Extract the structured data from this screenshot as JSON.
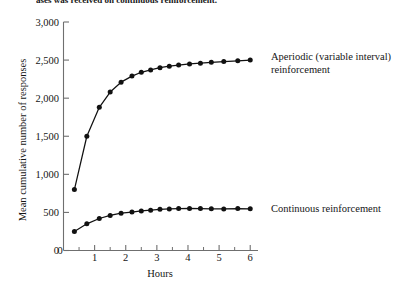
{
  "caption": {
    "text": "ases was received on continuous reinforcement."
  },
  "chart_data": {
    "type": "line",
    "title": "",
    "xlabel": "Hours",
    "ylabel": "Mean cumulative number of responses",
    "xlim": [
      0,
      6.25
    ],
    "ylim": [
      0,
      3000
    ],
    "grid": false,
    "legend_position": "inline-right",
    "x_ticks": [
      0,
      1,
      2,
      3,
      4,
      5,
      6
    ],
    "x_tick_labels": [
      "0",
      "1",
      "2",
      "3",
      "4",
      "5",
      "6"
    ],
    "x_minor_ticks": [
      0.5,
      1.5,
      2.5,
      3.5,
      4.5,
      5.5
    ],
    "y_ticks": [
      0,
      500,
      1000,
      1500,
      2000,
      2500,
      3000
    ],
    "y_tick_labels": [
      "0",
      "500",
      "1,000",
      "1,500",
      "2,000",
      "2,500",
      "3,000"
    ],
    "series": [
      {
        "name": "Aperiodic (variable interval) reinforcement",
        "label_line_1": "Aperiodic (variable interval)",
        "label_line_2": "reinforcement",
        "color": "#111111",
        "marker": "circle",
        "x": [
          0.35,
          0.75,
          1.15,
          1.5,
          1.85,
          2.2,
          2.5,
          2.8,
          3.1,
          3.4,
          3.7,
          4.05,
          4.4,
          4.75,
          5.15,
          5.6,
          6.0
        ],
        "y": [
          800,
          1500,
          1880,
          2080,
          2210,
          2290,
          2340,
          2370,
          2400,
          2420,
          2435,
          2450,
          2460,
          2470,
          2480,
          2490,
          2500
        ]
      },
      {
        "name": "Continuous reinforcement",
        "label_line_1": "Continuous reinforcement",
        "label_line_2": "",
        "color": "#111111",
        "marker": "circle",
        "x": [
          0.35,
          0.75,
          1.15,
          1.5,
          1.85,
          2.2,
          2.5,
          2.8,
          3.1,
          3.4,
          3.7,
          4.05,
          4.4,
          4.75,
          5.15,
          5.6,
          6.0
        ],
        "y": [
          250,
          350,
          420,
          460,
          490,
          505,
          520,
          530,
          540,
          545,
          550,
          552,
          550,
          548,
          545,
          550,
          548
        ]
      }
    ]
  },
  "colors": {
    "ink": "#111111",
    "axis": "#6f6f6f",
    "background": "#ffffff"
  }
}
